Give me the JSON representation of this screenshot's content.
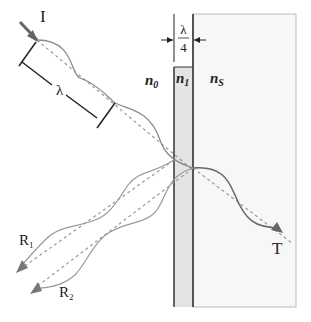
{
  "diagram": {
    "labels": {
      "incident": "I",
      "wavelength": "λ",
      "thickness_numerator": "λ",
      "thickness_denominator": "4",
      "medium_0": "n",
      "medium_0_sub": "0",
      "layer_1": "n",
      "layer_1_sub": "1",
      "substrate": "n",
      "substrate_sub": "S",
      "reflected_1": "R",
      "reflected_1_sub": "1",
      "reflected_2": "R",
      "reflected_2_sub": "2",
      "transmitted": "T"
    },
    "colors": {
      "wave": "#8a8a8a",
      "wave_transmitted": "#666666",
      "arrow": "#777777",
      "dashed": "#999999",
      "layer_fill": "#e4e4e4",
      "layer_border": "#333333",
      "substrate_fill": "#f7f7f7",
      "substrate_border": "#bbbbbb"
    }
  }
}
